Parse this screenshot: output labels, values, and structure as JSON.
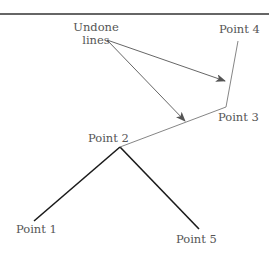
{
  "diagram": {
    "annotation": {
      "line1": "Undone",
      "line2": "lines"
    },
    "points": [
      {
        "id": 1,
        "label": "Point 1"
      },
      {
        "id": 2,
        "label": "Point 2"
      },
      {
        "id": 3,
        "label": "Point 3"
      },
      {
        "id": 4,
        "label": "Point 4"
      },
      {
        "id": 5,
        "label": "Point 5"
      }
    ],
    "colors": {
      "active_line": "#1a1a1a",
      "undone_line": "#777777",
      "arrow": "#555555",
      "rule": "#333333",
      "text": "#555555"
    }
  }
}
